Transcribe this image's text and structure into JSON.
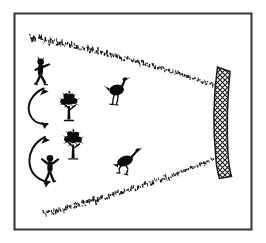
{
  "figure": {
    "title": "Funnel drive hunting with net trap",
    "medium": "black and white line drawing",
    "background_color": "#ffffff",
    "ink_color": "#0b0b0b",
    "frame_color": "#3a3a40",
    "frame": {
      "shape": "rectangle",
      "x": 14,
      "y": 13,
      "width": 238,
      "height": 217,
      "stroke_width": 2
    },
    "scene_description": "Two human beaters drive two large flightless birds down a funnel formed by two converging brush fences toward a curved mesh net at the right.",
    "elements": [
      {
        "name": "upper-brush-fence",
        "label": "Upper brush fence",
        "type": "stippled-line",
        "description": "Converging line of short brush strokes running from upper left down to the right toward the net",
        "from": [
          30,
          38
        ],
        "to": [
          214,
          86
        ],
        "mark_count": 150
      },
      {
        "name": "lower-brush-fence",
        "label": "Lower brush fence",
        "type": "stippled-line",
        "description": "Converging line of short brush strokes running from lower left up to the right toward the net",
        "from": [
          44,
          215
        ],
        "to": [
          214,
          160
        ],
        "mark_count": 150
      },
      {
        "name": "mesh-net",
        "label": "Mesh net trap",
        "type": "curved-hatched-band",
        "description": "Vertical slightly bowed band filled with diamond cross-hatch mesh at the narrow end of the funnel",
        "top": [
          218,
          67
        ],
        "bottom": [
          222,
          178
        ],
        "width": 14,
        "fill": "diamond-mesh"
      },
      {
        "name": "beater-upper",
        "label": "Upper beater",
        "type": "human-silhouette",
        "pose": "striding right, arms raised forward",
        "position": [
          34,
          62
        ],
        "height": 26
      },
      {
        "name": "beater-lower",
        "label": "Lower beater",
        "type": "human-silhouette",
        "pose": "standing, both arms raised in a V",
        "position": [
          42,
          158
        ],
        "height": 26
      },
      {
        "name": "bush-upper",
        "label": "Upper bush",
        "type": "shrub-silhouette",
        "position": [
          64,
          98
        ],
        "height": 26
      },
      {
        "name": "bush-lower",
        "label": "Lower bush",
        "type": "shrub-silhouette",
        "position": [
          68,
          136
        ],
        "height": 26
      },
      {
        "name": "bird-upper",
        "label": "Upper bird",
        "type": "ratite-silhouette",
        "pose": "standing, head up, facing right",
        "position": [
          110,
          82
        ],
        "height": 26
      },
      {
        "name": "bird-lower",
        "label": "Lower bird",
        "type": "ratite-silhouette",
        "pose": "running right, body low",
        "position": [
          118,
          152
        ],
        "height": 24
      },
      {
        "name": "motion-arrow-upper",
        "label": "Upper motion arrow",
        "type": "curved-double-arrow",
        "description": "C-shaped arc bulging left with arrowheads at both ends showing the upper beater's back-and-forth sweep",
        "start": [
          42,
          88
        ],
        "end": [
          48,
          123
        ]
      },
      {
        "name": "motion-arrow-lower",
        "label": "Lower motion arrow",
        "type": "curved-double-arrow",
        "description": "C-shaped arc bulging left with arrowheads at both ends showing the lower beater's back-and-forth sweep",
        "start": [
          44,
          136
        ],
        "end": [
          50,
          182
        ]
      }
    ]
  }
}
